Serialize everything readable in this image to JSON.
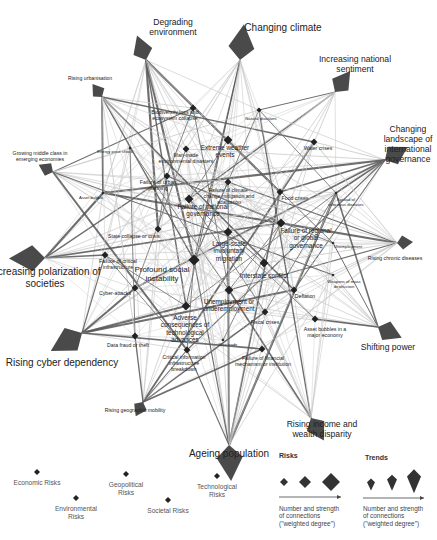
{
  "trends": [
    {
      "id": "degrading_environment",
      "label": "Degrading environment",
      "x": 146,
      "y": 60,
      "tx": 173,
      "ty": 18,
      "size": "m"
    },
    {
      "id": "changing_climate",
      "label": "Changing climate",
      "x": 240,
      "y": 60,
      "tx": 283,
      "ty": 22,
      "size": "l"
    },
    {
      "id": "increasing_national_sentiment",
      "label": "Increasing national sentiment",
      "x": 335,
      "y": 92,
      "tx": 355,
      "ty": 55,
      "size": "m"
    },
    {
      "id": "changing_landscape_intl_governance",
      "label": "Changing landscape of international governance",
      "x": 385,
      "y": 160,
      "tx": 408,
      "ty": 125,
      "size": "m"
    },
    {
      "id": "rising_chronic_diseases",
      "label": "Rising chronic diseases",
      "x": 397,
      "y": 243,
      "tx": 395,
      "ty": 256,
      "size": "s"
    },
    {
      "id": "shifting_power",
      "label": "Shifting power",
      "x": 378,
      "y": 327,
      "tx": 388,
      "ty": 343,
      "size": "m"
    },
    {
      "id": "rising_income_wealth_disparity",
      "label": "Rising income and wealth disparity",
      "x": 311,
      "y": 418,
      "tx": 322,
      "ty": 420,
      "size": "m"
    },
    {
      "id": "ageing_population",
      "label": "Ageing population",
      "x": 229,
      "y": 445,
      "tx": 229,
      "ty": 448,
      "size": "l"
    },
    {
      "id": "rising_geographic_mobility",
      "label": "Rising geographic mobility",
      "x": 143,
      "y": 402,
      "tx": 135,
      "ty": 408,
      "size": "s"
    },
    {
      "id": "rising_cyber_dependency",
      "label": "Rising cyber dependency",
      "x": 82,
      "y": 333,
      "tx": 62,
      "ty": 357,
      "size": "l"
    },
    {
      "id": "increasing_polarization",
      "label": "Increasing polarization of societies",
      "x": 45,
      "y": 258,
      "tx": 45,
      "ty": 266,
      "size": "l"
    },
    {
      "id": "growing_middle_class",
      "label": "Growing middle class in emerging economies",
      "x": 53,
      "y": 172,
      "tx": 40,
      "ty": 151,
      "size": "s"
    },
    {
      "id": "rising_urbanisation",
      "label": "Rising urbanisation",
      "x": 102,
      "y": 97,
      "tx": 90,
      "ty": 76,
      "size": "s"
    }
  ],
  "risks": [
    {
      "id": "biodiversity_loss",
      "label": "Biodiversity loss and ecosystem collapse",
      "x": 193,
      "y": 108,
      "tx": 175,
      "ty": 110,
      "cat": "environmental",
      "size": "m"
    },
    {
      "id": "natural_disasters",
      "label": "Natural disasters",
      "x": 259,
      "y": 110,
      "tx": 261,
      "ty": 117,
      "cat": "environmental",
      "size": "s"
    },
    {
      "id": "extreme_weather",
      "label": "Extreme weather events",
      "x": 228,
      "y": 140,
      "tx": 225,
      "ty": 144,
      "cat": "environmental",
      "size": "l"
    },
    {
      "id": "man_made_env_disasters",
      "label": "Man-made environmental disasters",
      "x": 186,
      "y": 149,
      "tx": 186,
      "ty": 153,
      "cat": "environmental",
      "size": "m"
    },
    {
      "id": "water_crises",
      "label": "Water crises",
      "x": 314,
      "y": 142,
      "tx": 318,
      "ty": 146,
      "cat": "societal",
      "size": "m"
    },
    {
      "id": "energy_price_shock",
      "label": "Energy price shock",
      "x": 130,
      "y": 148,
      "tx": 115,
      "ty": 150,
      "cat": "economic",
      "size": "xs"
    },
    {
      "id": "failure_urban_planning",
      "label": "Failure of urban planning",
      "x": 167,
      "y": 176,
      "tx": 158,
      "ty": 180,
      "cat": "societal",
      "size": "m"
    },
    {
      "id": "failure_climate_change",
      "label": "Failure of climate-change mitigation and adaptation",
      "x": 228,
      "y": 182,
      "tx": 229,
      "ty": 188,
      "cat": "environmental",
      "size": "m"
    },
    {
      "id": "food_crises",
      "label": "Food crises",
      "x": 280,
      "y": 192,
      "tx": 295,
      "ty": 196,
      "cat": "societal",
      "size": "m"
    },
    {
      "id": "spread_infectious_diseases",
      "label": "Spread of infectious diseases",
      "x": 336,
      "y": 193,
      "tx": 346,
      "ty": 198,
      "cat": "societal",
      "size": "xs"
    },
    {
      "id": "asset_bubble_small",
      "label": "Asset bubble",
      "x": 103,
      "y": 193,
      "tx": 91,
      "ty": 196,
      "cat": "economic",
      "size": "xs"
    },
    {
      "id": "failure_national_governance",
      "label": "Failure of national governance",
      "x": 189,
      "y": 199,
      "tx": 203,
      "ty": 203,
      "cat": "geopolitical",
      "size": "l"
    },
    {
      "id": "failure_regional_global_governance",
      "label": "Failure of regional or global governance",
      "x": 281,
      "y": 223,
      "tx": 306,
      "ty": 227,
      "cat": "geopolitical",
      "size": "l"
    },
    {
      "id": "state_collapse",
      "label": "State collapse or crisis",
      "x": 158,
      "y": 229,
      "tx": 134,
      "ty": 234,
      "cat": "geopolitical",
      "size": "m"
    },
    {
      "id": "large_scale_migration",
      "label": "Large-scale involuntary migration",
      "x": 228,
      "y": 232,
      "tx": 229,
      "ty": 240,
      "cat": "societal",
      "size": "l"
    },
    {
      "id": "unemployment_note",
      "label": "Unemployment",
      "x": 333,
      "y": 243,
      "tx": 348,
      "ty": 245,
      "cat": "economic",
      "size": "xs"
    },
    {
      "id": "failure_critical_infrastructure",
      "label": "Failure of critical infrastructure",
      "x": 105,
      "y": 255,
      "tx": 118,
      "ty": 259,
      "cat": "economic",
      "size": "m"
    },
    {
      "id": "profound_social_instability",
      "label": "Profound social instability",
      "x": 194,
      "y": 260,
      "tx": 162,
      "ty": 265,
      "cat": "societal",
      "size": "xl"
    },
    {
      "id": "interstate_conflict",
      "label": "Interstate conflict",
      "x": 264,
      "y": 263,
      "tx": 264,
      "ty": 272,
      "cat": "geopolitical",
      "size": "l"
    },
    {
      "id": "wmd",
      "label": "Weapons of mass destruction",
      "x": 333,
      "y": 275,
      "tx": 344,
      "ty": 280,
      "cat": "geopolitical",
      "size": "xs"
    },
    {
      "id": "cyber_attacks",
      "label": "Cyber-attacks",
      "x": 135,
      "y": 288,
      "tx": 115,
      "ty": 291,
      "cat": "technological",
      "size": "m"
    },
    {
      "id": "unemployment",
      "label": "Unemployment or underemployment",
      "x": 229,
      "y": 290,
      "tx": 229,
      "ty": 298,
      "cat": "economic",
      "size": "l"
    },
    {
      "id": "deflation",
      "label": "Deflation",
      "x": 294,
      "y": 290,
      "tx": 305,
      "ty": 294,
      "cat": "economic",
      "size": "m"
    },
    {
      "id": "adverse_tech",
      "label": "Adverse consequences of technological advances",
      "x": 186,
      "y": 306,
      "tx": 185,
      "ty": 314,
      "cat": "technological",
      "size": "l"
    },
    {
      "id": "fiscal_crises",
      "label": "Fiscal crises",
      "x": 265,
      "y": 312,
      "tx": 265,
      "ty": 320,
      "cat": "economic",
      "size": "m"
    },
    {
      "id": "asset_bubbles",
      "label": "Asset bubbles in a major economy",
      "x": 315,
      "y": 319,
      "tx": 325,
      "ty": 327,
      "cat": "economic",
      "size": "m"
    },
    {
      "id": "data_fraud",
      "label": "Data fraud or theft",
      "x": 135,
      "y": 336,
      "tx": 128,
      "ty": 343,
      "cat": "technological",
      "size": "m"
    },
    {
      "id": "illicit_trade",
      "label": "Illicit trade",
      "x": 223,
      "y": 340,
      "tx": 228,
      "ty": 343,
      "cat": "economic",
      "size": "xs"
    },
    {
      "id": "critical_info_infrastructure",
      "label": "Critical information infrastructure breakdown",
      "x": 187,
      "y": 350,
      "tx": 184,
      "ty": 355,
      "cat": "technological",
      "size": "m"
    },
    {
      "id": "failure_financial_mechanism",
      "label": "Failure of financial mechanism or institution",
      "x": 262,
      "y": 349,
      "tx": 263,
      "ty": 356,
      "cat": "economic",
      "size": "m"
    }
  ],
  "labels": {
    "profound_social_instability_l1": "Profound social",
    "profound_social_instability_l2": "instability"
  },
  "legend": {
    "categories": [
      {
        "label": "Economic Risks",
        "x": 37,
        "y": 472
      },
      {
        "label": "Environmental Risks",
        "x": 76,
        "y": 498
      },
      {
        "label": "Geopolitical Risks",
        "x": 126,
        "y": 474
      },
      {
        "label": "Societal Risks",
        "x": 168,
        "y": 500
      },
      {
        "label": "Technological Risks",
        "x": 217,
        "y": 476
      }
    ],
    "risks_heading": "Risks",
    "trends_heading": "Trends",
    "risks_desc": [
      "Number and strength",
      "of connections",
      "(\"weighted degree\")"
    ],
    "trends_desc": [
      "Number and strength",
      "of connections",
      "(\"weighted degree\")"
    ]
  },
  "colors": {
    "node": "#222222",
    "trend": "#4a4a4a",
    "edge_dark": "#555555",
    "edge_light": "#c8c8c8"
  }
}
